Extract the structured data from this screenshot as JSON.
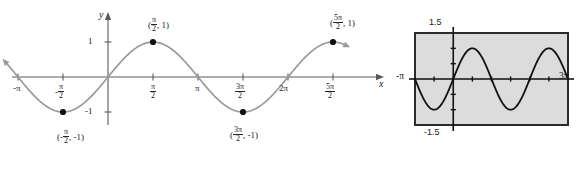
{
  "figure": {
    "axis_color": "#5a5a5a",
    "curve_color": "#9a9a9a",
    "point_color": "#111111",
    "calculator_screen_fill": "#dcdcdc",
    "calculator_border": "#2b2b2b",
    "calculator_curve_color": "#111111"
  },
  "main_graph": {
    "y_axis_name": "y",
    "x_axis_name": "x",
    "y_ticks": [
      {
        "value": 1,
        "label": "1"
      },
      {
        "value": -1,
        "label": "-1"
      }
    ],
    "x_ticks": [
      {
        "value": -3.14159265,
        "text": "-π",
        "type": "plain"
      },
      {
        "value": -1.57079633,
        "text": "-",
        "num": "π",
        "den": "2",
        "type": "fraction"
      },
      {
        "value": 1.57079633,
        "text": "",
        "num": "π",
        "den": "2",
        "type": "fraction"
      },
      {
        "value": 3.14159265,
        "text": "π",
        "type": "plain"
      },
      {
        "value": 4.71238898,
        "text": "",
        "num": "3π",
        "den": "2",
        "type": "fraction"
      },
      {
        "value": 6.28318531,
        "text": "2π",
        "type": "plain"
      },
      {
        "value": 7.85398163,
        "text": "",
        "num": "5π",
        "den": "2",
        "type": "fraction"
      }
    ],
    "points": [
      {
        "x": -1.57079633,
        "y": -1,
        "label_open": "(-",
        "num": "π",
        "den": "2",
        "label_close": ", -1)"
      },
      {
        "x": 1.57079633,
        "y": 1,
        "label_open": "(",
        "num": "π",
        "den": "2",
        "label_close": ", 1)"
      },
      {
        "x": 4.71238898,
        "y": -1,
        "label_open": "(",
        "num": "3π",
        "den": "2",
        "label_close": ", -1)"
      },
      {
        "x": 7.85398163,
        "y": 1,
        "label_open": "(",
        "num": "5π",
        "den": "2",
        "label_close": ", 1)"
      }
    ]
  },
  "chart_data": {
    "type": "line",
    "title": "",
    "xlabel": "x",
    "ylabel": "y",
    "function": "y = sin x",
    "xlim": [
      -3.5,
      8.5
    ],
    "ylim": [
      -1.6,
      1.6
    ],
    "grid": false,
    "legend": "none",
    "series": [
      {
        "name": "y = sin x",
        "x": [
          -3.14159265,
          -2.35619449,
          -1.57079633,
          -0.78539816,
          0,
          0.78539816,
          1.57079633,
          2.35619449,
          3.14159265,
          3.92699082,
          4.71238898,
          5.49778714,
          6.28318531,
          7.06858347,
          7.85398163
        ],
        "y": [
          0,
          -0.70710678,
          -1,
          -0.70710678,
          0,
          0.70710678,
          1,
          0.70710678,
          0,
          -0.70710678,
          -1,
          -0.70710678,
          0,
          0.70710678,
          1
        ]
      }
    ],
    "annotations": [
      {
        "x": -1.57079633,
        "y": -1,
        "text": "(-π/2, -1)"
      },
      {
        "x": 1.57079633,
        "y": 1,
        "text": "(π/2, 1)"
      },
      {
        "x": 4.71238898,
        "y": -1,
        "text": "(3π/2, -1)"
      },
      {
        "x": 7.85398163,
        "y": 1,
        "text": "(5π/2, 1)"
      }
    ]
  },
  "calculator": {
    "top_label": "1.5",
    "bottom_label": "-1.5",
    "left_label": "-π",
    "right_label": "3π",
    "window": {
      "xmin": -3.14159265,
      "xmax": 9.42477796,
      "ymin": -1.5,
      "ymax": 1.5
    },
    "chart_data": {
      "type": "line",
      "function": "y = sin x",
      "xlim": [
        -3.14159265,
        9.42477796
      ],
      "ylim": [
        -1.5,
        1.5
      ],
      "grid": false,
      "series": [
        {
          "name": "y = sin x",
          "amplitude": 1,
          "period": 6.28318531,
          "phase": 0
        }
      ]
    }
  }
}
